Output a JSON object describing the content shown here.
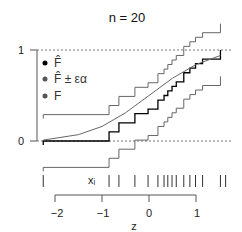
{
  "chart_data": {
    "type": "line",
    "title": "n = 20",
    "xlabel": "z",
    "ylabel": "",
    "xlim": [
      -2.3,
      1.55
    ],
    "ylim": [
      -0.35,
      1.3
    ],
    "x_ticks": [
      -2,
      -1,
      0,
      1
    ],
    "x_tick_labels": [
      "−2",
      "−1",
      "0",
      "1"
    ],
    "y_ticks": [
      0,
      1
    ],
    "y_tick_labels": [
      "0",
      "1"
    ],
    "reference_lines": [
      {
        "y": 0,
        "style": "dotted"
      },
      {
        "y": 1,
        "style": "dotted"
      }
    ],
    "rug_label": "xᵢ",
    "sample_points": [
      -2.25,
      -0.85,
      -0.64,
      -0.3,
      -0.02,
      0.19,
      0.32,
      0.4,
      0.49,
      0.58,
      0.74,
      0.87,
      0.99,
      1.14,
      1.52,
      1.63
    ],
    "legend": [
      {
        "label": "F̂",
        "color": "#000000",
        "series": "ecdf"
      },
      {
        "label": "F̂ ± εα",
        "color": "#555555",
        "series": "bands"
      },
      {
        "label": "F",
        "color": "#555555",
        "series": "true_cdf"
      }
    ],
    "series": [
      {
        "name": "ecdf",
        "color": "#000000",
        "type": "step",
        "x": [
          -2.25,
          -0.85,
          -0.64,
          -0.3,
          -0.02,
          0.19,
          0.32,
          0.4,
          0.49,
          0.58,
          0.74,
          0.87,
          0.99,
          1.14,
          1.52
        ],
        "values": [
          0.0,
          0.1,
          0.2,
          0.3,
          0.35,
          0.45,
          0.5,
          0.55,
          0.6,
          0.65,
          0.75,
          0.8,
          0.85,
          0.9,
          1.0
        ]
      },
      {
        "name": "upper_band",
        "color": "#666666",
        "type": "step",
        "x": [
          -2.25,
          -0.85,
          -0.64,
          -0.3,
          -0.02,
          0.19,
          0.32,
          0.4,
          0.49,
          0.58,
          0.74,
          0.87,
          0.99,
          1.14,
          1.52
        ],
        "values": [
          0.29,
          0.39,
          0.49,
          0.59,
          0.64,
          0.74,
          0.79,
          0.84,
          0.89,
          0.94,
          1.04,
          1.09,
          1.14,
          1.19,
          1.29
        ]
      },
      {
        "name": "lower_band",
        "color": "#666666",
        "type": "step",
        "x": [
          -2.25,
          -0.85,
          -0.64,
          -0.3,
          -0.02,
          0.19,
          0.32,
          0.4,
          0.49,
          0.58,
          0.74,
          0.87,
          0.99,
          1.14,
          1.52
        ],
        "values": [
          -0.29,
          -0.19,
          -0.09,
          0.01,
          0.06,
          0.16,
          0.21,
          0.26,
          0.31,
          0.36,
          0.46,
          0.51,
          0.56,
          0.61,
          0.71
        ]
      },
      {
        "name": "true_cdf",
        "color": "#666666",
        "type": "smooth",
        "x": [
          -2.25,
          -1.5,
          -1.0,
          -0.5,
          0.0,
          0.5,
          1.0,
          1.52
        ],
        "values": [
          0.01,
          0.07,
          0.16,
          0.31,
          0.5,
          0.69,
          0.84,
          0.94
        ]
      }
    ]
  }
}
